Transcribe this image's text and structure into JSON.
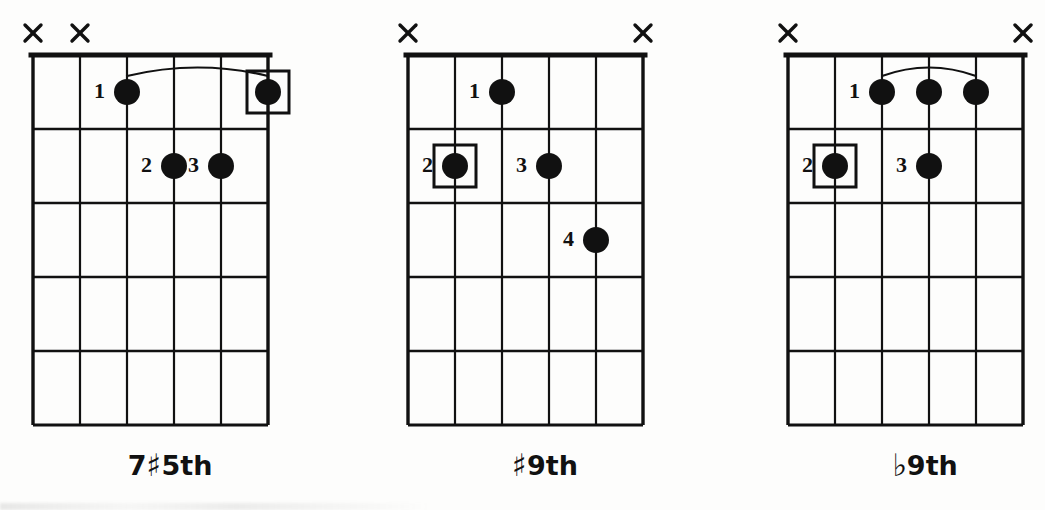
{
  "page": {
    "kind": "guitar-chord-diagram-sheet",
    "background_color": "#ffffff",
    "ink_color": "#111111",
    "diagram_count": 3
  },
  "chart_data": {
    "type": "table",
    "columns": [
      "chord_label",
      "muted_strings",
      "fingerings",
      "barre"
    ],
    "diagrams": [
      {
        "label_text": "7♯5th",
        "label_parts": {
          "prefix": "7",
          "accidental": "♯",
          "suffix": "5th"
        },
        "strings": 6,
        "frets": 5,
        "muted_strings": [
          6,
          5
        ],
        "open_strings": [],
        "fingerings": [
          {
            "finger": "1",
            "string": 4,
            "fret": 1,
            "boxed": false,
            "label_side": "left"
          },
          {
            "finger": "",
            "string": 1,
            "fret": 1,
            "boxed": true,
            "label_side": "none"
          },
          {
            "finger": "2",
            "string": 3,
            "fret": 2,
            "boxed": false,
            "label_side": "left"
          },
          {
            "finger": "3",
            "string": 2,
            "fret": 2,
            "boxed": false,
            "label_side": "left"
          }
        ],
        "barre": {
          "present": true,
          "fret": 1,
          "from_string": 4,
          "to_string": 1
        }
      },
      {
        "label_text": "♯9th",
        "label_parts": {
          "prefix": "",
          "accidental": "♯",
          "suffix": "9th"
        },
        "strings": 6,
        "frets": 5,
        "muted_strings": [
          6,
          1
        ],
        "open_strings": [],
        "fingerings": [
          {
            "finger": "1",
            "string": 4,
            "fret": 1,
            "boxed": false,
            "label_side": "left"
          },
          {
            "finger": "2",
            "string": 5,
            "fret": 2,
            "boxed": true,
            "label_side": "left"
          },
          {
            "finger": "3",
            "string": 3,
            "fret": 2,
            "boxed": false,
            "label_side": "left"
          },
          {
            "finger": "4",
            "string": 2,
            "fret": 3,
            "boxed": false,
            "label_side": "left"
          }
        ],
        "barre": {
          "present": false,
          "fret": 0,
          "from_string": 0,
          "to_string": 0
        }
      },
      {
        "label_text": "♭9th",
        "label_parts": {
          "prefix": "",
          "accidental": "♭",
          "suffix": "9th"
        },
        "strings": 6,
        "frets": 5,
        "muted_strings": [
          6,
          1
        ],
        "open_strings": [],
        "fingerings": [
          {
            "finger": "1",
            "string": 4,
            "fret": 1,
            "boxed": false,
            "label_side": "left"
          },
          {
            "finger": "",
            "string": 3,
            "fret": 1,
            "boxed": false,
            "label_side": "none"
          },
          {
            "finger": "",
            "string": 2,
            "fret": 1,
            "boxed": false,
            "label_side": "none"
          },
          {
            "finger": "2",
            "string": 5,
            "fret": 2,
            "boxed": true,
            "label_side": "left"
          },
          {
            "finger": "3",
            "string": 3,
            "fret": 2,
            "boxed": false,
            "label_side": "left"
          }
        ],
        "barre": {
          "present": true,
          "fret": 1,
          "from_string": 4,
          "to_string": 2
        }
      }
    ],
    "labels": [
      "7♯5th",
      "♯9th",
      "♭9th"
    ],
    "mute_marker": "×"
  },
  "geometry": {
    "diagram_left_positions": [
      0,
      375,
      755
    ],
    "grid_left": 33,
    "grid_top": 55,
    "string_spacing": 47,
    "fret_spacing": 74,
    "nut_thickness": 5,
    "dot_radius": 13,
    "label_baseline_y": 470
  }
}
